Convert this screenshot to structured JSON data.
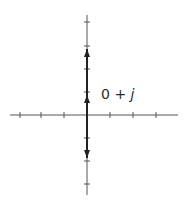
{
  "diagram": {
    "title": "",
    "type": "complex-plane-phasor",
    "colors": {
      "background": "#ffffff",
      "axis": "#555555",
      "vector": "#222222",
      "text": "#2a2a2a"
    },
    "axes": {
      "origin": {
        "x": 87,
        "y": 115
      },
      "horizontal": {
        "x_start": 10,
        "x_end": 178,
        "ticks_x": [
          20,
          41,
          64,
          110,
          133,
          156
        ]
      },
      "vertical": {
        "y_start": 15,
        "y_end": 195,
        "ticks_y": [
          22,
          46,
          69,
          92,
          138,
          161,
          184
        ]
      }
    },
    "vectors": [
      {
        "name": "up-vector",
        "from": [
          87,
          115
        ],
        "to": [
          87,
          49
        ],
        "mid_arrow_y": 95
      },
      {
        "name": "down-vector",
        "from": [
          87,
          115
        ],
        "to": [
          87,
          158
        ]
      }
    ],
    "label": {
      "real": "0",
      "operator": "+",
      "imag": "j"
    }
  }
}
